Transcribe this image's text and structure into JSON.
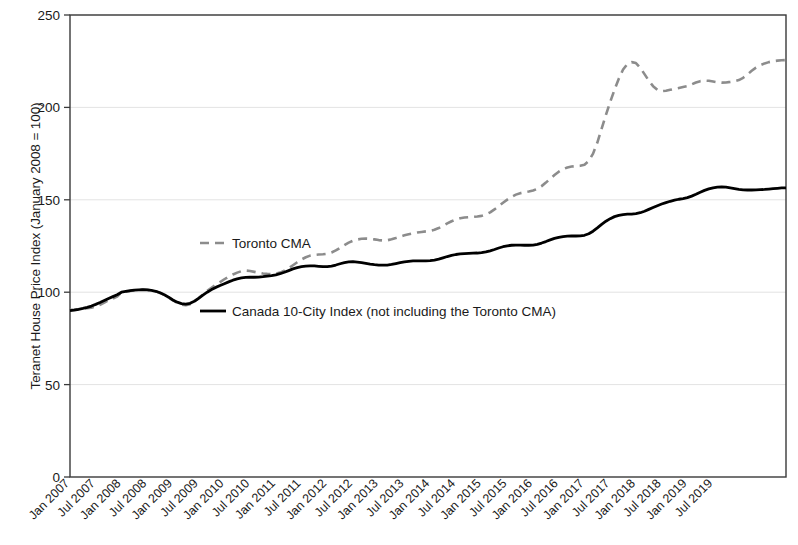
{
  "chart_data": {
    "type": "line",
    "title": "",
    "xlabel": "",
    "ylabel": "Teranet House Price Index (January 2008 = 100)",
    "ylim": [
      0,
      250
    ],
    "yticks": [
      0,
      50,
      100,
      150,
      200,
      250
    ],
    "grid": true,
    "legend_position": "inside-plot",
    "x_tick_labels": [
      "Jan 2007",
      "Jul 2007",
      "Jan 2008",
      "Jul 2008",
      "Jan 2009",
      "Jul 2009",
      "Jan 2010",
      "Jul 2010",
      "Jan 2011",
      "Jul 2011",
      "Jan 2012",
      "Jul 2012",
      "Jan 2013",
      "Jul 2013",
      "Jan 2014",
      "Jul 2014",
      "Jan 2015",
      "Jul 2015",
      "Jan 2016",
      "Jul 2016",
      "Jan 2017",
      "Jul 2017",
      "Jan 2018",
      "Jul 2018",
      "Jan 2019",
      "Jul 2019"
    ],
    "x_start": "Jan 2007",
    "x_end": "Dec 2019",
    "x_frequency": "monthly",
    "series": [
      {
        "name": "Toronto CMA",
        "style": "dashed",
        "color": "#8c8c8c",
        "values": [
          90.5,
          90.6,
          90.8,
          91.0,
          91.3,
          91.6,
          92.2,
          93.2,
          94.4,
          95.6,
          96.6,
          97.6,
          100.0,
          100.3,
          100.6,
          101.0,
          101.3,
          101.4,
          101.3,
          101.0,
          100.5,
          99.6,
          98.5,
          97.2,
          95.6,
          94.3,
          93.3,
          93.0,
          93.5,
          94.9,
          96.8,
          98.8,
          100.7,
          102.4,
          104.0,
          105.5,
          107.0,
          108.4,
          109.6,
          110.6,
          111.4,
          111.7,
          111.5,
          111.0,
          110.5,
          110.1,
          109.9,
          109.8,
          110.0,
          110.6,
          111.6,
          113.0,
          114.6,
          116.2,
          117.7,
          118.9,
          119.8,
          120.2,
          120.4,
          120.5,
          120.8,
          121.5,
          122.6,
          124.0,
          125.5,
          126.8,
          127.8,
          128.5,
          128.9,
          129.0,
          128.9,
          128.6,
          128.2,
          128.0,
          128.1,
          128.6,
          129.3,
          130.1,
          130.8,
          131.4,
          131.9,
          132.3,
          132.6,
          132.9,
          133.2,
          133.8,
          134.7,
          135.9,
          137.2,
          138.4,
          139.3,
          140.0,
          140.4,
          140.6,
          140.8,
          141.0,
          141.3,
          142.0,
          143.2,
          144.8,
          146.6,
          148.4,
          150.1,
          151.6,
          152.8,
          153.6,
          154.1,
          154.5,
          155.0,
          155.9,
          157.4,
          159.3,
          161.4,
          163.4,
          165.2,
          166.6,
          167.5,
          168.0,
          168.2,
          168.4,
          169.0,
          171.0,
          175.0,
          181.0,
          188.5,
          196.0,
          203.0,
          209.5,
          215.5,
          220.5,
          223.5,
          224.5,
          224.0,
          221.5,
          218.0,
          214.5,
          211.5,
          209.5,
          208.8,
          209.0,
          209.5,
          210.0,
          210.5,
          211.0,
          211.5,
          212.5,
          213.5,
          214.2,
          214.5,
          214.4,
          214.0,
          213.6,
          213.4,
          213.5,
          213.8,
          214.2,
          214.8,
          216.0,
          217.8,
          219.8,
          221.5,
          222.8,
          223.8,
          224.5,
          225.0,
          225.3,
          225.5,
          225.6
        ]
      },
      {
        "name": "Canada 10-City Index (not including the Toronto CMA)",
        "style": "solid",
        "color": "#000000",
        "values": [
          90.0,
          90.3,
          90.7,
          91.2,
          91.8,
          92.5,
          93.4,
          94.4,
          95.5,
          96.6,
          97.6,
          98.6,
          100.0,
          100.4,
          100.8,
          101.1,
          101.3,
          101.4,
          101.3,
          101.0,
          100.5,
          99.7,
          98.6,
          97.3,
          95.8,
          94.6,
          93.8,
          93.6,
          94.0,
          95.1,
          96.7,
          98.4,
          100.0,
          101.4,
          102.6,
          103.6,
          104.6,
          105.6,
          106.5,
          107.2,
          107.7,
          108.0,
          108.1,
          108.1,
          108.2,
          108.4,
          108.7,
          109.0,
          109.4,
          110.0,
          110.8,
          111.7,
          112.6,
          113.3,
          113.8,
          114.1,
          114.2,
          114.2,
          114.0,
          113.8,
          113.8,
          114.1,
          114.7,
          115.4,
          116.0,
          116.4,
          116.5,
          116.3,
          116.0,
          115.6,
          115.2,
          114.9,
          114.7,
          114.6,
          114.7,
          115.0,
          115.5,
          116.0,
          116.4,
          116.7,
          116.9,
          117.0,
          117.0,
          117.0,
          117.1,
          117.4,
          117.9,
          118.6,
          119.3,
          119.9,
          120.4,
          120.7,
          120.9,
          121.0,
          121.1,
          121.2,
          121.4,
          121.8,
          122.4,
          123.1,
          123.9,
          124.6,
          125.1,
          125.4,
          125.5,
          125.5,
          125.4,
          125.4,
          125.5,
          125.9,
          126.6,
          127.4,
          128.3,
          129.1,
          129.7,
          130.1,
          130.3,
          130.4,
          130.4,
          130.5,
          130.8,
          131.6,
          133.0,
          134.8,
          136.7,
          138.4,
          139.8,
          140.9,
          141.6,
          142.0,
          142.2,
          142.3,
          142.5,
          143.0,
          143.8,
          144.8,
          145.8,
          146.8,
          147.7,
          148.5,
          149.2,
          149.8,
          150.3,
          150.7,
          151.2,
          152.0,
          153.0,
          154.1,
          155.1,
          155.9,
          156.5,
          156.9,
          157.0,
          156.8,
          156.4,
          156.0,
          155.6,
          155.4,
          155.3,
          155.3,
          155.4,
          155.5,
          155.6,
          155.8,
          156.0,
          156.2,
          156.4,
          156.5
        ]
      }
    ],
    "legend": [
      {
        "label": "Toronto CMA",
        "style": "dashed",
        "color": "#8c8c8c"
      },
      {
        "label": "Canada 10-City Index (not including the Toronto CMA)",
        "style": "solid",
        "color": "#000000"
      }
    ]
  }
}
